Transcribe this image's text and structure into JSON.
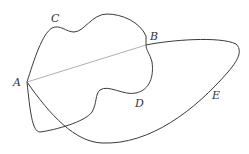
{
  "diagram": {
    "points": {
      "A": {
        "label": "A",
        "x": 27,
        "y": 82,
        "label_x": 13,
        "label_y": 86
      },
      "B": {
        "label": "B",
        "x": 146,
        "y": 45,
        "label_x": 150,
        "label_y": 40
      }
    },
    "curves": {
      "C": {
        "label": "C",
        "label_x": 51,
        "label_y": 22
      },
      "D": {
        "label": "D",
        "label_x": 135,
        "label_y": 107
      },
      "E": {
        "label": "E",
        "label_x": 212,
        "label_y": 99
      }
    },
    "chord": {
      "from": "A",
      "to": "B"
    },
    "colors": {
      "curve": "#3a3a3a",
      "chord": "#9a9a9a",
      "background": "#ffffff"
    }
  }
}
